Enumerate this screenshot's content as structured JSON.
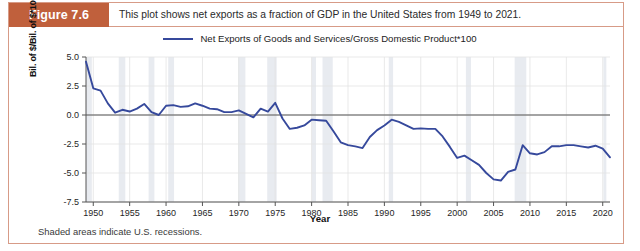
{
  "figure": {
    "badge_label": "Figure 7.6",
    "caption": "This plot shows net exports as a fraction of GDP in the United States from 1949 to 2021.",
    "footnote": "Shaded areas indicate U.S. recessions.",
    "badge_color": "#c0603c",
    "border_color": "#d79b87"
  },
  "chart_data": {
    "type": "line",
    "title": "",
    "xlabel": "Year",
    "ylabel": "Bil. of $/Bil. of $*100",
    "xlim": [
      1949,
      2021
    ],
    "ylim": [
      -7.5,
      5.0
    ],
    "xticks": [
      1950,
      1955,
      1960,
      1965,
      1970,
      1975,
      1980,
      1985,
      1990,
      1995,
      2000,
      2005,
      2010,
      2015,
      2020
    ],
    "yticks": [
      5.0,
      2.5,
      0.0,
      -2.5,
      -5.0,
      -7.5
    ],
    "grid": true,
    "legend_position": "top-center",
    "line_color": "#36499c",
    "recession_band_color": "#e8ebf0",
    "series": [
      {
        "name": "Net Exports of Goods and Services/Gross Domestic Product*100",
        "x": [
          1949,
          1950,
          1951,
          1952,
          1953,
          1954,
          1955,
          1956,
          1957,
          1958,
          1959,
          1960,
          1961,
          1962,
          1963,
          1964,
          1965,
          1966,
          1967,
          1968,
          1969,
          1970,
          1971,
          1972,
          1973,
          1974,
          1975,
          1976,
          1977,
          1978,
          1979,
          1980,
          1981,
          1982,
          1983,
          1984,
          1985,
          1986,
          1987,
          1988,
          1989,
          1990,
          1991,
          1992,
          1993,
          1994,
          1995,
          1996,
          1997,
          1998,
          1999,
          2000,
          2001,
          2002,
          2003,
          2004,
          2005,
          2006,
          2007,
          2008,
          2009,
          2010,
          2011,
          2012,
          2013,
          2014,
          2015,
          2016,
          2017,
          2018,
          2019,
          2020,
          2021
        ],
        "y": [
          4.6,
          2.3,
          2.1,
          1.0,
          0.2,
          0.45,
          0.3,
          0.55,
          0.95,
          0.25,
          0.0,
          0.8,
          0.85,
          0.7,
          0.75,
          1.0,
          0.8,
          0.55,
          0.5,
          0.25,
          0.25,
          0.4,
          0.1,
          -0.2,
          0.55,
          0.3,
          1.05,
          -0.3,
          -1.2,
          -1.1,
          -0.9,
          -0.4,
          -0.45,
          -0.5,
          -1.4,
          -2.35,
          -2.6,
          -2.7,
          -2.85,
          -1.9,
          -1.3,
          -0.9,
          -0.4,
          -0.6,
          -0.9,
          -1.2,
          -1.15,
          -1.2,
          -1.2,
          -1.85,
          -2.75,
          -3.7,
          -3.5,
          -3.9,
          -4.3,
          -5.0,
          -5.55,
          -5.65,
          -4.9,
          -4.7,
          -2.6,
          -3.3,
          -3.4,
          -3.2,
          -2.7,
          -2.7,
          -2.6,
          -2.6,
          -2.7,
          -2.8,
          -2.65,
          -2.9,
          -3.65
        ]
      }
    ],
    "recessions": [
      {
        "start": 1949.0,
        "end": 1949.8
      },
      {
        "start": 1953.5,
        "end": 1954.4
      },
      {
        "start": 1957.6,
        "end": 1958.4
      },
      {
        "start": 1960.3,
        "end": 1961.1
      },
      {
        "start": 1969.9,
        "end": 1970.9
      },
      {
        "start": 1973.9,
        "end": 1975.2
      },
      {
        "start": 1980.0,
        "end": 1980.6
      },
      {
        "start": 1981.5,
        "end": 1982.9
      },
      {
        "start": 1990.6,
        "end": 1991.2
      },
      {
        "start": 2001.2,
        "end": 2001.9
      },
      {
        "start": 2007.9,
        "end": 2009.5
      },
      {
        "start": 2020.1,
        "end": 2020.5
      }
    ]
  },
  "legend": {
    "entry_label": "Net Exports of Goods and Services/Gross Domestic Product*100"
  }
}
